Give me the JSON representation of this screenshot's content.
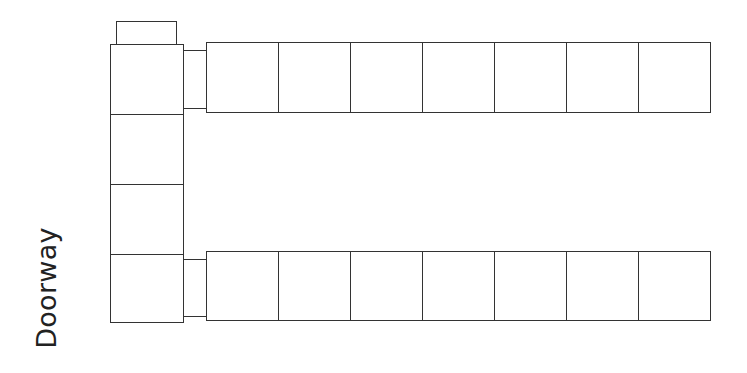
{
  "diagram": {
    "label": "Doorway",
    "stroke_color": "#333333",
    "background": "#ffffff",
    "tab": {
      "x": 116,
      "y": 21,
      "w": 61,
      "h": 24
    },
    "left_column": [
      {
        "x": 110,
        "y": 44,
        "w": 74,
        "h": 71
      },
      {
        "x": 110,
        "y": 114,
        "w": 74,
        "h": 71
      },
      {
        "x": 110,
        "y": 184,
        "w": 74,
        "h": 71
      },
      {
        "x": 110,
        "y": 254,
        "w": 74,
        "h": 69
      }
    ],
    "connectors": [
      {
        "x": 183,
        "y": 50,
        "w": 24,
        "h": 59
      },
      {
        "x": 183,
        "y": 259,
        "w": 24,
        "h": 58
      }
    ],
    "top_row": {
      "x": 206,
      "y": 42,
      "box_w": 72,
      "h": 71,
      "count": 7
    },
    "bottom_row": {
      "x": 206,
      "y": 251,
      "box_w": 72,
      "h": 70,
      "count": 7
    }
  }
}
